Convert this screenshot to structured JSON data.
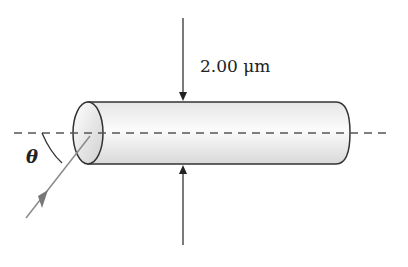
{
  "figure": {
    "dimension_label": "2.00 μm",
    "angle_label": "θ",
    "elements": {
      "cylinder": "optical fiber cylinder",
      "axis": "dashed central axis",
      "incident_ray": "incident light ray with arrow",
      "dimension_arrows": "top and bottom arrows indicating diameter"
    },
    "colors": {
      "outline": "#333333",
      "ray": "#8a8a8a",
      "cylinder_fill_light": "#ffffff",
      "cylinder_fill_dark": "#d8d8d8"
    }
  }
}
